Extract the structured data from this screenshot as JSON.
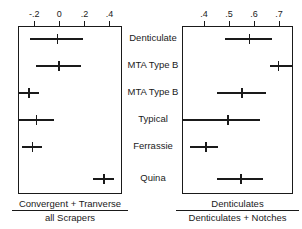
{
  "figure": {
    "kind": "forest-plot-pair",
    "background": "#ffffff",
    "line_color": "#1a1a1a"
  },
  "categories": [
    "Denticulate",
    "MTA Type B",
    "MTA Type B",
    "Typical",
    "Ferrassie",
    "Quina"
  ],
  "chart_data": [
    {
      "type": "scatter",
      "id": "left-panel",
      "title": "",
      "xlabel_numerator": "Convergent + Tranverse",
      "xlabel_denominator": "all Scrapers",
      "ylabel": "",
      "grid": false,
      "legend": "none",
      "axis_position": "top",
      "xlim": [
        -0.33,
        0.5
      ],
      "xticks": [
        -0.2,
        0,
        0.2,
        0.4
      ],
      "xticklabels": [
        "-.2",
        "0",
        ".2",
        ".4"
      ],
      "categories": [
        "Denticulate",
        "MTA Type B",
        "MTA Type B",
        "Typical",
        "Ferrassie",
        "Quina"
      ],
      "values": [
        -0.02,
        -0.01,
        -0.25,
        -0.19,
        -0.22,
        0.35
      ],
      "ci_low": [
        -0.235,
        -0.185,
        -0.335,
        -0.335,
        -0.3,
        0.265
      ],
      "ci_high": [
        0.19,
        0.175,
        -0.165,
        -0.04,
        -0.135,
        0.44
      ]
    },
    {
      "type": "scatter",
      "id": "right-panel",
      "title": "",
      "xlabel_numerator": "Denticulates",
      "xlabel_denominator": "Denticulates + Notches",
      "ylabel": "",
      "grid": false,
      "legend": "none",
      "axis_position": "top",
      "xlim": [
        0.312,
        0.756
      ],
      "xticks": [
        0.4,
        0.5,
        0.6,
        0.7
      ],
      "xticklabels": [
        ".4",
        ".5",
        ".6",
        ".7"
      ],
      "categories": [
        "Denticulate",
        "MTA Type B",
        "MTA Type B",
        "Typical",
        "Ferrassie",
        "Quina"
      ],
      "values": [
        0.578,
        0.694,
        0.548,
        0.492,
        0.405,
        0.545
      ],
      "ci_low": [
        0.482,
        0.662,
        0.452,
        0.312,
        0.345,
        0.452
      ],
      "ci_high": [
        0.672,
        0.756,
        0.648,
        0.625,
        0.455,
        0.635
      ]
    }
  ],
  "left_panel": {
    "ticks": [
      {
        "label": "-.2",
        "value": -0.2
      },
      {
        "label": "0",
        "value": 0
      },
      {
        "label": ".2",
        "value": 0.2
      },
      {
        "label": ".4",
        "value": 0.4
      }
    ],
    "caption_numerator": "Convergent + Tranverse",
    "caption_denominator": "all Scrapers"
  },
  "right_panel": {
    "ticks": [
      {
        "label": ".4",
        "value": 0.4
      },
      {
        "label": ".5",
        "value": 0.5
      },
      {
        "label": ".6",
        "value": 0.6
      },
      {
        "label": ".7",
        "value": 0.7
      }
    ],
    "caption_numerator": "Denticulates",
    "caption_denominator": "Denticulates + Notches"
  }
}
